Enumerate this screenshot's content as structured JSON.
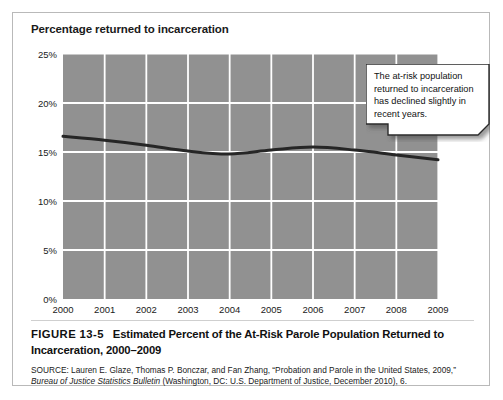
{
  "figure": {
    "chart_title": "Percentage returned to incarceration",
    "caption_number": "FIGURE 13-5",
    "caption_text": "Estimated Percent of the At-Risk Parole Population Returned to Incarceration, 2000–2009",
    "source_label": "SOURCE:",
    "source_part1": " Lauren E. Glaze, Thomas P. Bonczar, and Fan Zhang, “Probation and Parole in the United States, 2009,” ",
    "source_italic": "Bureau of Justice Statistics Bulletin",
    "source_part2": " (Washington, DC: U.S. Department of Justice, December 2010), 6."
  },
  "callout": {
    "text": "The at-risk population returned to incarceration has declined slightly in recent years.",
    "fill": "#ffffff",
    "border": "#2b2b2b"
  },
  "chart_data": {
    "type": "line",
    "title": "Percentage returned to incarceration",
    "xlabel": "",
    "ylabel": "Percentage returned to incarceration",
    "x": [
      "2000",
      "2001",
      "2002",
      "2003",
      "2004",
      "2005",
      "2006",
      "2007",
      "2008",
      "2009"
    ],
    "categories": [
      "2000",
      "2001",
      "2002",
      "2003",
      "2004",
      "2005",
      "2006",
      "2007",
      "2008",
      "2009"
    ],
    "values": [
      16.6,
      16.2,
      15.7,
      15.1,
      14.8,
      15.2,
      15.5,
      15.2,
      14.7,
      14.2
    ],
    "series": [
      {
        "name": "Percent returned to incarceration",
        "values": [
          16.6,
          16.2,
          15.7,
          15.1,
          14.8,
          15.2,
          15.5,
          15.2,
          14.7,
          14.2
        ]
      }
    ],
    "ylim": [
      0,
      25
    ],
    "yticks": [
      0,
      5,
      10,
      15,
      20,
      25
    ],
    "ytick_labels": [
      "0%",
      "5%",
      "10%",
      "15%",
      "20%",
      "25%"
    ],
    "grid": true,
    "legend": false,
    "plot_background": "#919191",
    "gridline_color": "#ffffff",
    "line_color": "#262626",
    "line_width": 3
  }
}
